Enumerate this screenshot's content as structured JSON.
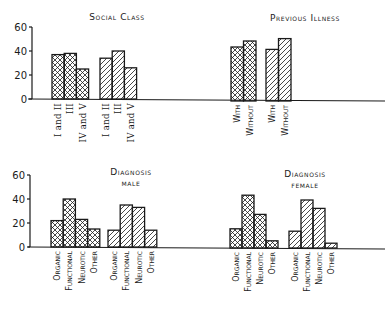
{
  "chart_data": [
    {
      "type": "bar",
      "title": "Social Class",
      "categories": [
        "I and II",
        "III",
        "IV and V"
      ],
      "series": [
        {
          "name": "crosshatched",
          "pattern": "crosshatch",
          "values": [
            37,
            38,
            25
          ]
        },
        {
          "name": "hatched",
          "pattern": "diagonal",
          "values": [
            34,
            40,
            26
          ]
        }
      ],
      "ylim": [
        0,
        60
      ],
      "yticks": [
        "0",
        "20",
        "40",
        "60"
      ],
      "xlabel": "",
      "ylabel": "",
      "grid": false,
      "legend": null
    },
    {
      "type": "bar",
      "title": "Previous Illness",
      "categories": [
        "With",
        "Without"
      ],
      "series": [
        {
          "name": "crosshatched",
          "pattern": "crosshatch",
          "values": [
            45,
            50
          ]
        },
        {
          "name": "hatched",
          "pattern": "diagonal",
          "values": [
            43,
            52
          ]
        }
      ],
      "ylim": [
        0,
        60
      ],
      "xlabel": "",
      "ylabel": "",
      "grid": false,
      "legend": null
    },
    {
      "type": "bar",
      "title": "Diagnosis male",
      "categories": [
        "Organic",
        "Functional",
        "Neurotic",
        "Other"
      ],
      "series": [
        {
          "name": "crosshatched",
          "pattern": "crosshatch",
          "values": [
            22,
            40,
            23,
            15
          ]
        },
        {
          "name": "hatched",
          "pattern": "diagonal",
          "values": [
            14,
            35,
            33,
            14
          ]
        }
      ],
      "ylim": [
        0,
        60
      ],
      "yticks": [
        "0",
        "20",
        "40",
        "60"
      ],
      "xlabel": "",
      "ylabel": "",
      "grid": false,
      "legend": null
    },
    {
      "type": "bar",
      "title": "Diagnosis female",
      "categories": [
        "Organic",
        "Functional",
        "Neurotic",
        "Other"
      ],
      "series": [
        {
          "name": "crosshatched",
          "pattern": "crosshatch",
          "values": [
            16,
            44,
            28,
            6
          ]
        },
        {
          "name": "hatched",
          "pattern": "diagonal",
          "values": [
            14,
            40,
            33,
            4
          ]
        }
      ],
      "ylim": [
        0,
        60
      ],
      "xlabel": "",
      "ylabel": "",
      "grid": false,
      "legend": null
    }
  ],
  "labels": {
    "social_title": "Social Class",
    "illness_title": "Previous Illness",
    "diag_title": "Diagnosis",
    "male": "male",
    "female": "female",
    "ticks": [
      "0",
      "20",
      "40",
      "60"
    ]
  },
  "colors": {
    "ink": "#1a1a1a",
    "paper": "#ffffff"
  }
}
